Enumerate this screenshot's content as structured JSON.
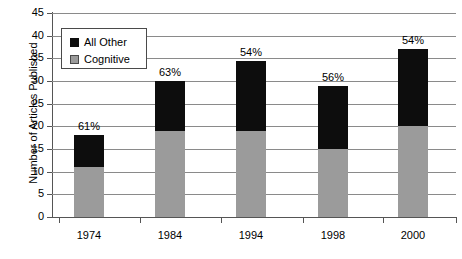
{
  "chart_data": {
    "type": "bar",
    "subtype": "stacked",
    "title": "",
    "xlabel": "",
    "ylabel": "Number of Articles Published",
    "categories": [
      "1974",
      "1984",
      "1994",
      "1998",
      "2000"
    ],
    "ylim": [
      0,
      45
    ],
    "ytick_step": 5,
    "yticks": [
      "45",
      "40",
      "35",
      "30",
      "25",
      "20",
      "15",
      "10",
      "5",
      "0"
    ],
    "grid": true,
    "legend_position": "upper-left-inside",
    "series": [
      {
        "name": "Cognitive",
        "color": "#9b9b9b",
        "values": [
          11,
          19,
          19,
          15,
          20
        ]
      },
      {
        "name": "All Other",
        "color": "#0d0d0d",
        "values": [
          7,
          11,
          15.5,
          14,
          17
        ]
      }
    ],
    "totals": [
      18,
      30,
      34.5,
      29,
      37
    ],
    "annotations": [
      "61%",
      "63%",
      "54%",
      "56%",
      "54%"
    ]
  },
  "legend": {
    "items": [
      {
        "label": "All Other",
        "swatch": "black-square-swatch"
      },
      {
        "label": "Cognitive",
        "swatch": "gray-square-swatch"
      }
    ]
  }
}
